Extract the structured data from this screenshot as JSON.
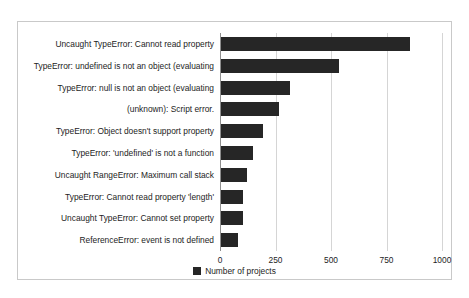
{
  "chart_data": {
    "type": "bar",
    "orientation": "horizontal",
    "title": "",
    "xlabel": "",
    "ylabel": "",
    "xlim": [
      0,
      1000
    ],
    "xticks": [
      0,
      250,
      500,
      750,
      1000
    ],
    "xtick_labels": [
      "0",
      "250",
      "500",
      "750",
      "1000"
    ],
    "grid": true,
    "legend_position": "bottom-center",
    "legend": [
      "Number of projects"
    ],
    "series_name": "Number of projects",
    "bar_color": "#262626",
    "categories": [
      "Uncaught TypeError: Cannot read property",
      "TypeError: undefined is not an object (evaluating",
      "TypeError: null is not an object (evaluating",
      "(unknown): Script error.",
      "TypeError: Object doesn't support property",
      "TypeError: 'undefined' is not a function",
      "Uncaught RangeError: Maximum call stack",
      "TypeError: Cannot read property 'length'",
      "Uncaught TypeError: Cannot set property",
      "ReferenceError: event is not defined"
    ],
    "values": [
      850,
      530,
      310,
      260,
      190,
      145,
      115,
      100,
      100,
      75
    ]
  },
  "figure": {
    "border_color": "#c9c9c9",
    "background": "#ffffff"
  }
}
